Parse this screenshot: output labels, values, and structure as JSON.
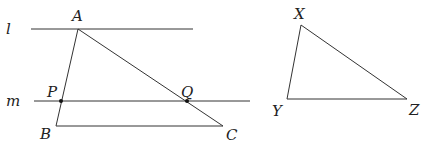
{
  "diagram": {
    "lines": {
      "l": {
        "label": "l"
      },
      "m": {
        "label": "m"
      }
    },
    "triangle_abc": {
      "vertices": {
        "A": "A",
        "B": "B",
        "C": "C"
      },
      "points_on_sides": {
        "P": "P",
        "Q": "Q"
      }
    },
    "triangle_xyz": {
      "vertices": {
        "X": "X",
        "Y": "Y",
        "Z": "Z"
      }
    },
    "colors": {
      "stroke": "#333333",
      "background": "#ffffff"
    }
  }
}
